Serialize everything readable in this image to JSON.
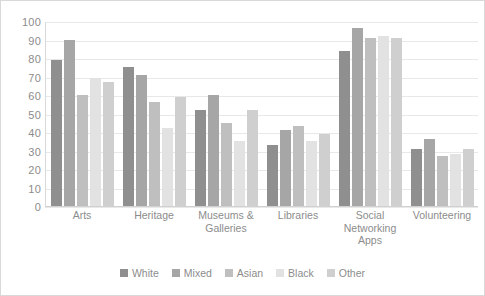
{
  "chart_data": {
    "type": "bar",
    "title": "",
    "xlabel": "",
    "ylabel": "",
    "ylim": [
      0,
      100
    ],
    "yticks": [
      100,
      90,
      80,
      70,
      60,
      50,
      40,
      30,
      20,
      10,
      0
    ],
    "grid": true,
    "legend_position": "bottom",
    "categories": [
      "Arts",
      "Heritage",
      "Museums & Galleries",
      "Libraries",
      "Social Networking Apps",
      "Volunteering"
    ],
    "series": [
      {
        "name": "White",
        "color": "#8f8f8f",
        "values": [
          79,
          75,
          52,
          33,
          84,
          31
        ]
      },
      {
        "name": "Mixed",
        "color": "#a6a6a6",
        "values": [
          90,
          71,
          60,
          41,
          96,
          36
        ]
      },
      {
        "name": "Asian",
        "color": "#bfbfbf",
        "values": [
          60,
          56,
          45,
          43,
          91,
          27
        ]
      },
      {
        "name": "Black",
        "color": "#e2e2e2",
        "values": [
          69,
          42,
          35,
          35,
          92,
          28
        ]
      },
      {
        "name": "Other",
        "color": "#cfcfcf",
        "values": [
          67,
          59,
          52,
          39,
          91,
          31
        ]
      }
    ]
  },
  "axis": {
    "y_tick_labels": [
      "100",
      "90",
      "80",
      "70",
      "60",
      "50",
      "40",
      "30",
      "20",
      "10",
      "0"
    ]
  },
  "x_labels": [
    "Arts",
    "Heritage",
    "Museums & Galleries",
    "Libraries",
    "Social Networking Apps",
    "Volunteering"
  ],
  "legend": {
    "items": [
      {
        "label": "White",
        "color": "#8f8f8f"
      },
      {
        "label": "Mixed",
        "color": "#a6a6a6"
      },
      {
        "label": "Asian",
        "color": "#bfbfbf"
      },
      {
        "label": "Black",
        "color": "#e2e2e2"
      },
      {
        "label": "Other",
        "color": "#cfcfcf"
      }
    ]
  }
}
